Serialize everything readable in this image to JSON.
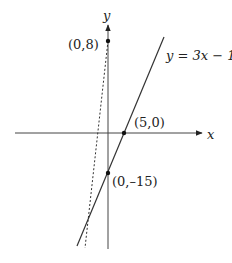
{
  "diagram": {
    "axes": {
      "x_label": "x",
      "y_label": "y"
    },
    "lines": [
      {
        "name": "solid-line",
        "equation_label": "y = 3x − 15",
        "style": "solid"
      },
      {
        "name": "dashed-line",
        "style": "dashed"
      }
    ],
    "points": [
      {
        "name": "point-0-8",
        "label": "(0,8)"
      },
      {
        "name": "point-5-0",
        "label": "(5,0)"
      },
      {
        "name": "point-0-neg15",
        "label": "(0,–15)"
      }
    ],
    "colors": {
      "line": "#333333",
      "background": "#ffffff"
    }
  }
}
